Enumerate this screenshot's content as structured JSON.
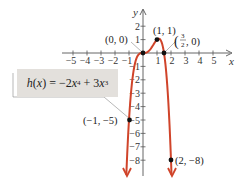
{
  "chart_data": {
    "type": "line",
    "title": "",
    "function_label": "h(x) = −2x⁴ + 3x³",
    "function_parts": {
      "name": "h",
      "var": "x",
      "term1_coef": "−2",
      "term1_exp": "4",
      "term2_coef": "3",
      "term2_exp": "3"
    },
    "xlabel": "x",
    "ylabel": "y",
    "xlim": [
      -5,
      5
    ],
    "ylim": [
      -8,
      2
    ],
    "x_ticks": [
      "−5",
      "−4",
      "−3",
      "−2",
      "−1",
      "1",
      "2",
      "3",
      "4",
      "5"
    ],
    "y_ticks": [
      "2",
      "1",
      "−1",
      "−2",
      "−3",
      "−4",
      "−5",
      "−6",
      "−7",
      "−8"
    ],
    "grid": false,
    "series": [
      {
        "name": "h(x) = −2x⁴ + 3x³",
        "color": "#d0442a",
        "x": [
          -1.2,
          -1,
          -0.5,
          0,
          0.5,
          1,
          1.5,
          2,
          2.05
        ],
        "y": [
          -9.33,
          -5,
          -0.5,
          0,
          0.25,
          1,
          0,
          -8,
          -9.4
        ]
      }
    ],
    "labeled_points": [
      {
        "label": "(0, 0)",
        "x": 0,
        "y": 0
      },
      {
        "label": "(1, 1)",
        "x": 1,
        "y": 1
      },
      {
        "label": "(3/2, 0)",
        "x": 1.5,
        "y": 0
      },
      {
        "label": "(−1, −5)",
        "x": -1,
        "y": -5
      },
      {
        "label": "(2, −8)",
        "x": 2,
        "y": -8
      }
    ]
  },
  "labels": {
    "p00": "(0, 0)",
    "p11": "(1, 1)",
    "p32_open": "(",
    "p32_num": "3",
    "p32_den": "2",
    "p32_close": ", 0)",
    "pm1m5": "(−1, −5)",
    "p2m8": "(2, −8)",
    "x_axis": "x",
    "y_axis": "y"
  }
}
